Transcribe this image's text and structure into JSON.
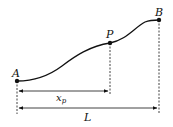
{
  "diagram": {
    "points": [
      {
        "id": "A",
        "label": "A",
        "x": 17,
        "y": 81
      },
      {
        "id": "P",
        "label": "P",
        "x": 110,
        "y": 43
      },
      {
        "id": "B",
        "label": "B",
        "x": 159,
        "y": 20
      }
    ],
    "dimensions": [
      {
        "id": "xp",
        "label": "x",
        "subscript": "p",
        "from": "A",
        "to": "P"
      },
      {
        "id": "L",
        "label": "L",
        "from": "A",
        "to": "B"
      }
    ],
    "colors": {
      "stroke": "#111111",
      "background": "#ffffff"
    }
  }
}
